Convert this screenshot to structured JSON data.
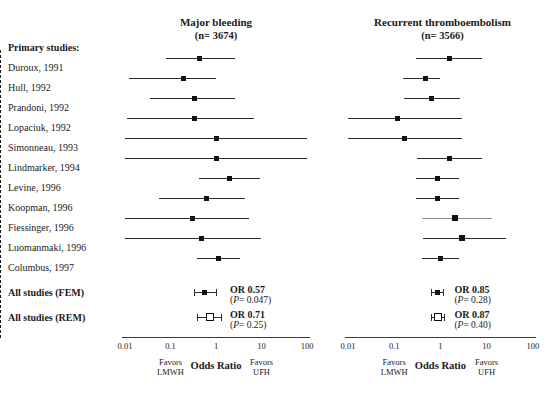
{
  "figure": {
    "type": "forest",
    "xlabel": "Odds Ratio",
    "favors_left": "Favors\nLMWH",
    "favors_left_l1": "Favors",
    "favors_left_l2": "LMWH",
    "favors_right_l1": "Favors",
    "favors_right_l2": "UFH",
    "ticks": [
      "0.01",
      "0.1",
      "1",
      "10",
      "100"
    ],
    "tick_values": [
      0.01,
      0.1,
      1,
      10,
      100
    ],
    "null_value": 1,
    "studies_header": "Primary studies:",
    "summary_rows": [
      "All studies (FEM)",
      "All studies (REM)"
    ],
    "studies": [
      "Duroux, 1991",
      "Hull, 1992",
      "Prandoni, 1992",
      "Lopaciuk, 1992",
      "Simonneau, 1993",
      "Lindmarker, 1994",
      "Levine, 1996",
      "Koopman, 1996",
      "Fiessinger, 1996",
      "Luomanmaki, 1996",
      "Columbus, 1997"
    ]
  },
  "chart_data": {
    "type": "forest",
    "title": "",
    "xlabel": "Odds Ratio",
    "xscale": "log",
    "xlim": [
      0.01,
      100
    ],
    "ticks": [
      0.01,
      0.1,
      1,
      10,
      100
    ],
    "grid": false,
    "categories": [
      "Duroux, 1991",
      "Hull, 1992",
      "Prandoni, 1992",
      "Lopaciuk, 1992",
      "Simonneau, 1993",
      "Lindmarker, 1994",
      "Levine, 1996",
      "Koopman, 1996",
      "Fiessinger, 1996",
      "Luomanmaki, 1996",
      "Columbus, 1997"
    ],
    "panels": [
      {
        "name": "Major bleeding",
        "title": "Major bleeding",
        "subtitle": "(n= 3674)",
        "n": 3674,
        "points": [
          {
            "study": "Duroux, 1991",
            "or": 0.43,
            "lo": 0.08,
            "hi": 2.6
          },
          {
            "study": "Hull, 1992",
            "or": 0.19,
            "lo": 0.012,
            "hi": 1.0
          },
          {
            "study": "Prandoni, 1992",
            "or": 0.33,
            "lo": 0.035,
            "hi": 2.6
          },
          {
            "study": "Lopaciuk, 1992",
            "or": 0.34,
            "lo": 0.011,
            "hi": 7.0
          },
          {
            "study": "Simonneau, 1993",
            "or": 1.0,
            "lo": 0.009,
            "hi": 100
          },
          {
            "study": "Lindmarker, 1994",
            "or": 1.0,
            "lo": 0.009,
            "hi": 100
          },
          {
            "study": "Levine, 1996",
            "or": 2.0,
            "lo": 0.43,
            "hi": 9.5
          },
          {
            "study": "Koopman, 1996",
            "or": 0.62,
            "lo": 0.055,
            "hi": 4.3
          },
          {
            "study": "Fiessinger, 1996",
            "or": 0.3,
            "lo": 0.009,
            "hi": 5.2
          },
          {
            "study": "Luomanmaki, 1996",
            "or": 0.48,
            "lo": 0.01,
            "hi": 9.6
          },
          {
            "study": "Columbus, 1997",
            "or": 1.15,
            "lo": 0.38,
            "hi": 3.4
          }
        ],
        "summary": [
          {
            "label": "All studies (FEM)",
            "or": 0.57,
            "or_text": "OR 0.57",
            "p_text": "(P= 0.047)",
            "p": 0.047,
            "lo": 0.33,
            "hi": 0.99,
            "marker": "filled"
          },
          {
            "label": "All studies (REM)",
            "or": 0.71,
            "or_text": "OR 0.71",
            "p_text": "(P= 0.25)",
            "p": 0.25,
            "lo": 0.39,
            "hi": 1.3,
            "marker": "open"
          }
        ]
      },
      {
        "name": "Recurrent thromboembolism",
        "title": "Recurrent thromboembolism",
        "subtitle": "(n= 3566)",
        "n": 3566,
        "points": [
          {
            "study": "Duroux, 1991",
            "or": 1.55,
            "lo": 0.3,
            "hi": 8.0
          },
          {
            "study": "Hull, 1992",
            "or": 0.47,
            "lo": 0.155,
            "hi": 1.0
          },
          {
            "study": "Prandoni, 1992",
            "or": 0.64,
            "lo": 0.16,
            "hi": 2.6
          },
          {
            "study": "Lopaciuk, 1992",
            "or": 0.12,
            "lo": 0.009,
            "hi": 3.0
          },
          {
            "study": "Simonneau, 1993",
            "or": 0.17,
            "lo": 0.009,
            "hi": 3.0
          },
          {
            "study": "Lindmarker, 1994",
            "or": 1.6,
            "lo": 0.31,
            "hi": 8.0
          },
          {
            "study": "Levine, 1996",
            "or": 0.86,
            "lo": 0.3,
            "hi": 2.5
          },
          {
            "study": "Koopman, 1996",
            "or": 0.88,
            "lo": 0.3,
            "hi": 2.5
          },
          {
            "study": "Fiessinger, 1996",
            "or": 2.1,
            "lo": 0.4,
            "hi": 13.0
          },
          {
            "study": "Luomanmaki, 1996",
            "or": 3.0,
            "lo": 0.43,
            "hi": 26.0
          },
          {
            "study": "Columbus, 1997",
            "or": 1.0,
            "lo": 0.4,
            "hi": 2.5
          }
        ],
        "summary": [
          {
            "label": "All studies (FEM)",
            "or": 0.85,
            "or_text": "OR 0.85",
            "p_text": "(P= 0.28)",
            "p": 0.28,
            "lo": 0.63,
            "hi": 1.14,
            "marker": "filled"
          },
          {
            "label": "All studies (REM)",
            "or": 0.87,
            "or_text": "OR 0.87",
            "p_text": "(P= 0.40)",
            "p": 0.4,
            "lo": 0.63,
            "hi": 1.22,
            "marker": "open"
          }
        ]
      }
    ]
  }
}
